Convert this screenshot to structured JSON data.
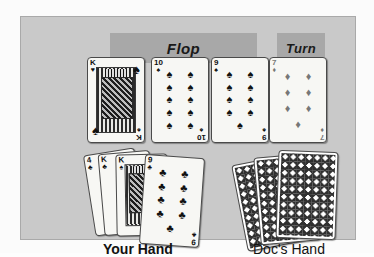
{
  "scene": {
    "title": "Texas Hold'em board and hands illustration",
    "panel_color": "#c9c9c9",
    "banner_color": "#a8a8a8",
    "card_face_color": "#f7f7f4",
    "ink_color": "#111111",
    "red_suit_render_color": "#777777"
  },
  "banners": {
    "flop": "Flop",
    "turn": "Turn"
  },
  "board": {
    "cards": [
      {
        "rank": "K",
        "suit_glyph": "♥",
        "suit_name": "hearts",
        "corner_glyph": "♠",
        "color": "black",
        "type": "face"
      },
      {
        "rank": "10",
        "suit_glyph": "♠",
        "suit_name": "spades",
        "color": "black",
        "pip_count": 10,
        "type": "pip"
      },
      {
        "rank": "9",
        "suit_glyph": "♠",
        "suit_name": "spades",
        "color": "black",
        "pip_count": 9,
        "type": "pip"
      },
      {
        "rank": "7",
        "suit_glyph": "♦",
        "suit_name": "diamonds",
        "color": "gray",
        "pip_count": 7,
        "type": "pip"
      }
    ]
  },
  "your_hand": {
    "label": "Your Hand",
    "cards": [
      {
        "rank": "4",
        "suit_glyph": "♣",
        "suit_name": "clubs",
        "color": "black",
        "type": "hidden"
      },
      {
        "rank": "K",
        "suit_glyph": "♣",
        "suit_name": "clubs",
        "color": "black",
        "type": "face"
      },
      {
        "rank": "K",
        "suit_glyph": "♠",
        "suit_name": "spades",
        "color": "black",
        "type": "face"
      },
      {
        "rank": "9",
        "suit_glyph": "♣",
        "suit_name": "clubs",
        "color": "black",
        "pip_count": 9,
        "type": "pip"
      }
    ]
  },
  "docs_hand": {
    "label": "Doc's Hand",
    "card_count": 3,
    "face": "down",
    "back_pattern": "diamond-lattice"
  },
  "pips": {
    "ten": [
      "♠",
      "♠",
      "♠",
      "♠",
      "♠",
      "♠",
      "♠",
      "♠",
      "♠",
      "♠"
    ],
    "nine": [
      "♠",
      "♠",
      "♠",
      "♠",
      "♠",
      "♠",
      "♠",
      "♠",
      "♠"
    ],
    "seven": [
      "♦",
      "♦",
      "♦",
      "♦",
      "♦",
      "♦",
      "♦"
    ],
    "nine_clubs": [
      "♣",
      "♣",
      "♣",
      "♣",
      "♣",
      "♣",
      "♣",
      "♣",
      "♣"
    ]
  }
}
